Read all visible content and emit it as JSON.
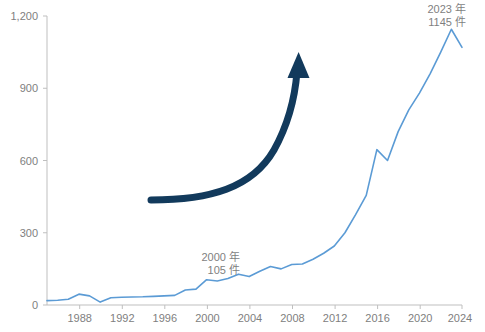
{
  "chart_data": {
    "type": "line",
    "title": "",
    "subtitle": "",
    "xlabel": "",
    "ylabel": "",
    "xlim": [
      1985,
      2024
    ],
    "ylim": [
      0,
      1200
    ],
    "grid": false,
    "legend": "none",
    "line_color": "#5B9BD5",
    "axis_color": "#BFBFBF",
    "tick_label_color": "#808080",
    "annotation_color": "#7F7F7F",
    "arrow_color": "#123A5C",
    "yticks": [
      0,
      300,
      600,
      900,
      1200
    ],
    "ytick_labels": [
      "0",
      "300",
      "600",
      "900",
      "1,200"
    ],
    "xticks": [
      1988,
      1992,
      1996,
      2000,
      2004,
      2008,
      2012,
      2016,
      2020,
      2024
    ],
    "xtick_labels": [
      "1988",
      "1992",
      "1996",
      "2000",
      "2004",
      "2008",
      "2012",
      "2016",
      "2020",
      "2024"
    ],
    "x": [
      1985,
      1986,
      1987,
      1988,
      1989,
      1990,
      1991,
      1992,
      1993,
      1994,
      1995,
      1996,
      1997,
      1998,
      1999,
      2000,
      2001,
      2002,
      2003,
      2004,
      2005,
      2006,
      2007,
      2008,
      2009,
      2010,
      2011,
      2012,
      2013,
      2014,
      2015,
      2016,
      2017,
      2018,
      2019,
      2020,
      2021,
      2022,
      2023,
      2024
    ],
    "values": [
      18,
      20,
      24,
      45,
      38,
      12,
      30,
      32,
      33,
      34,
      36,
      38,
      40,
      62,
      66,
      105,
      100,
      110,
      128,
      118,
      140,
      160,
      150,
      168,
      170,
      190,
      215,
      245,
      300,
      375,
      455,
      645,
      600,
      720,
      810,
      880,
      960,
      1050,
      1145,
      1070
    ],
    "series": [
      {
        "name": "件数",
        "values": [
          18,
          20,
          24,
          45,
          38,
          12,
          30,
          32,
          33,
          34,
          36,
          38,
          40,
          62,
          66,
          105,
          100,
          110,
          128,
          118,
          140,
          160,
          150,
          168,
          170,
          190,
          215,
          245,
          300,
          375,
          455,
          645,
          600,
          720,
          810,
          880,
          960,
          1050,
          1145,
          1070
        ]
      }
    ],
    "annotations": [
      {
        "id": "peak-2023",
        "line1": "2023 年",
        "line2": "1145 件",
        "x": 2023,
        "y": 1145
      },
      {
        "id": "point-2000",
        "line1": "2000 年",
        "line2": "105 件",
        "x": 2000,
        "y": 105
      }
    ],
    "overlay_arrow": {
      "name": "growth-arrow",
      "shape": "curved-up-right",
      "color": "#123A5C"
    }
  }
}
